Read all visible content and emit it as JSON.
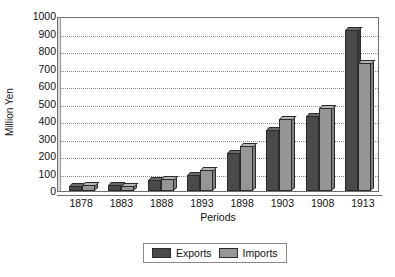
{
  "chart_data": {
    "type": "bar",
    "title": "",
    "xlabel": "Periods",
    "ylabel": "Million Yen",
    "categories": [
      "1878",
      "1883",
      "1888",
      "1893",
      "1898",
      "1903",
      "1908",
      "1913"
    ],
    "series": [
      {
        "name": "Exports",
        "color": "#4a4a4a",
        "values": [
          26,
          37,
          62,
          90,
          215,
          350,
          430,
          920
        ]
      },
      {
        "name": "Imports",
        "color": "#969696",
        "values": [
          33,
          30,
          66,
          120,
          255,
          410,
          475,
          730
        ]
      }
    ],
    "ylim": [
      0,
      1000
    ],
    "yticks": [
      0,
      100,
      200,
      300,
      400,
      500,
      600,
      700,
      800,
      900,
      1000
    ],
    "grid": true,
    "legend_position": "bottom"
  },
  "legend": {
    "entries": [
      {
        "label": "Exports"
      },
      {
        "label": "Imports"
      }
    ]
  }
}
